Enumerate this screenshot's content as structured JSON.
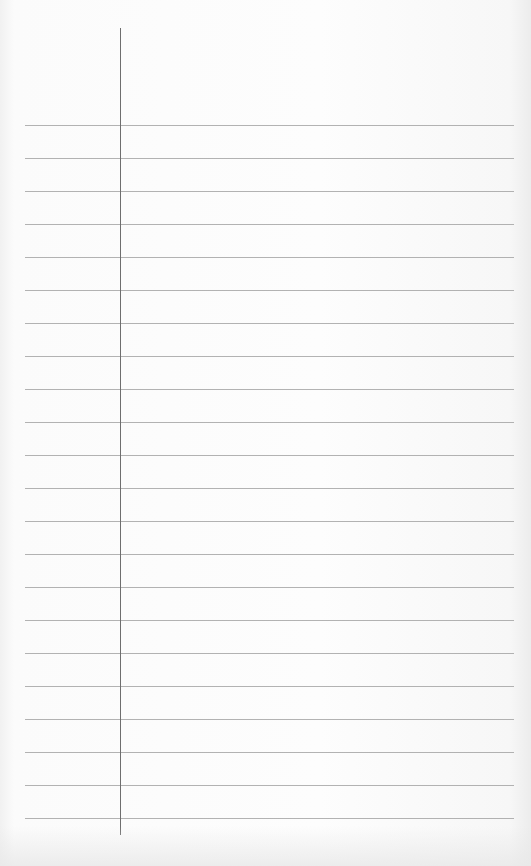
{
  "sheet": {
    "type": "lined-notebook-paper",
    "background_color": "#fcfcfc",
    "rule_color": "#9a9a9a",
    "margin_line_color": "#6e6e6e",
    "margin_line": {
      "x": 120,
      "top": 28,
      "bottom": 835
    },
    "rules": {
      "count": 22,
      "first_y": 125,
      "spacing": 33,
      "left": 25,
      "right": 514
    },
    "text": []
  }
}
